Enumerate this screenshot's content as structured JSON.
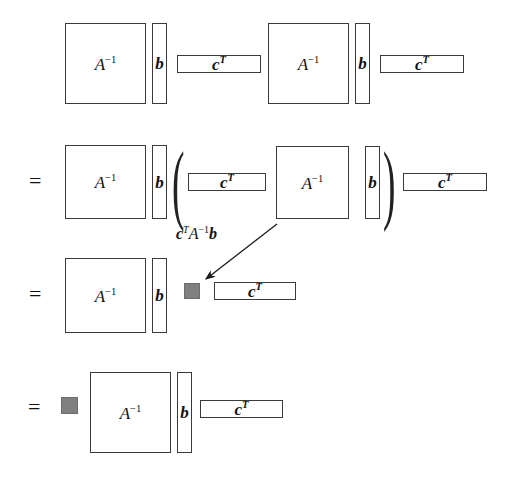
{
  "figure": {
    "type": "matrix-block-diagram",
    "background_color": "#ffffff",
    "line_color": "#3a3a3a",
    "scalar_fill_color": "#808080",
    "text_color": "#111111"
  },
  "symbols": {
    "matrix_base": "A",
    "matrix_exponent": "−1",
    "column_vector": "b",
    "row_vector_base": "c",
    "row_vector_exponent": "T",
    "equals": "=",
    "paren_open": "(",
    "paren_close": ")"
  },
  "annotation": {
    "scalar_label_c": "c",
    "scalar_label_c_sup": "T",
    "scalar_label_a": "A",
    "scalar_label_a_sup": "−1",
    "scalar_label_b": "b",
    "meaning": "c^T A^-1 b is a scalar"
  },
  "rows": [
    {
      "id": "row-1",
      "has_equals": false,
      "blocks": [
        "A-inverse",
        "b",
        "c-transpose",
        "A-inverse",
        "b",
        "c-transpose"
      ]
    },
    {
      "id": "row-2",
      "has_equals": true,
      "blocks": [
        "A-inverse",
        "b",
        "(",
        "c-transpose",
        "A-inverse",
        "b",
        ")",
        "c-transpose"
      ]
    },
    {
      "id": "row-3",
      "has_equals": true,
      "blocks": [
        "A-inverse",
        "b",
        "scalar",
        "c-transpose"
      ]
    },
    {
      "id": "row-4",
      "has_equals": true,
      "blocks": [
        "scalar",
        "A-inverse",
        "b",
        "c-transpose"
      ]
    }
  ]
}
